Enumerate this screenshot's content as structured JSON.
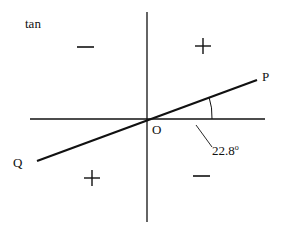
{
  "diagram": {
    "function_label": "tan",
    "points": {
      "P": "P",
      "Q": "Q",
      "O": "O"
    },
    "angle": {
      "value": "22.8",
      "unit": "o"
    },
    "quadrant_signs": {
      "upper_left": "negative",
      "upper_right": "positive",
      "lower_left": "positive",
      "lower_right": "negative"
    },
    "colors": {
      "stroke": "#111111",
      "background": "#ffffff"
    }
  }
}
